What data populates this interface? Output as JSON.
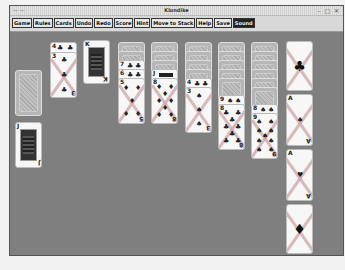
{
  "window": {
    "title": "Klondike",
    "controls": [
      "minimize",
      "maximize",
      "close"
    ]
  },
  "menu": {
    "buttons": [
      {
        "label": "Game"
      },
      {
        "label": "Rules"
      },
      {
        "label": "Cards"
      },
      {
        "label": "Undo"
      },
      {
        "label": "Redo"
      },
      {
        "label": "Score"
      },
      {
        "label": "Hint"
      },
      {
        "label": "Move to Stack"
      },
      {
        "label": "Help"
      },
      {
        "label": "Save"
      },
      {
        "label": "Sound",
        "active": true
      }
    ]
  },
  "stock": {
    "state": "face-down"
  },
  "waste": [
    {
      "rank": "4",
      "suit": "♣"
    },
    {
      "rank": "3",
      "suit": "♣"
    },
    {
      "rank": "K",
      "suit": "♣"
    }
  ],
  "reserve_card": {
    "rank": "J",
    "suit": "♣"
  },
  "tableau": [
    {
      "face_down": 2,
      "face_up": [
        {
          "rank": "7",
          "suit": "♣"
        },
        {
          "rank": "6",
          "suit": "♣"
        },
        {
          "rank": "5",
          "suit": "♦"
        }
      ]
    },
    {
      "face_down": 3,
      "face_up": [
        {
          "rank": "J",
          "suit": "♣"
        },
        {
          "rank": "8",
          "suit": "♦"
        }
      ]
    },
    {
      "face_down": 4,
      "face_up": [
        {
          "rank": "4",
          "suit": "♣"
        },
        {
          "rank": "3",
          "suit": "♠"
        }
      ]
    },
    {
      "face_down": 5,
      "face_up": [
        {
          "rank": "9",
          "suit": "♠"
        },
        {
          "rank": "8",
          "suit": "♣"
        }
      ]
    },
    {
      "face_down": 6,
      "face_up": [
        {
          "rank": "8",
          "suit": "♠"
        },
        {
          "rank": "9",
          "suit": "♠"
        }
      ]
    }
  ],
  "foundations": [
    {
      "suit": "♣",
      "empty": true
    },
    {
      "rank": "A",
      "suit": "♠"
    },
    {
      "rank": "A",
      "suit": "♥"
    },
    {
      "suit": "♦",
      "empty": true
    }
  ]
}
